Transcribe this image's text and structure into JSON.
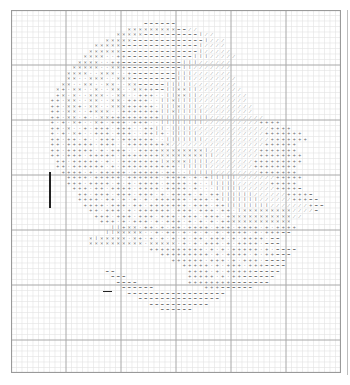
{
  "chart_data": {
    "type": "table",
    "title": "",
    "grid": {
      "columns": 60,
      "rows": 66,
      "cell_px": 5.5,
      "major_every": 10,
      "minor_color": "#e3e3e3",
      "major_color": "#a8a8a8",
      "border_color": "#9a9a9a"
    },
    "legend": {
      "x": "×",
      "+": "+",
      "-": "−",
      "/": "⁄",
      "|": "ǀ",
      ".": "·"
    },
    "pattern_rows": [
      "                                                            ",
      "                                                            ",
      "                        ------                              ",
      "                     xxxxxxxxx--//                          ",
      "                   xxxxx----------|//                       ",
      "                 xxxxx-------------|///                     ",
      "               xxxxx--------------|////                     ",
      "              xxxxxx--------------|/////                    ",
      "             xxxx..++------------|||/////                   ",
      "            xxxx..++-----------|||//////                    ",
      "           xxxxx..xx+----------||///////                    ",
      "          xxxx..xxx..+--------|||///////                    ",
      "          xx..xxx..xxx--------|||////////                   ",
      "         xx..xx..xx..xx-----|||||////////                   ",
      "        x+.xx..x..xx..xx++--||xx||////////                  ",
      "        +x.x..xxx..xx..+++..||xx||/////////                 ",
      "       ++.xx..xx..xx.++++..||x||||/////////                 ",
      "       ++.xx+.xx..xxx+++++.|||x|||//////////                ",
      "       ++.xx..+xxx..+++++++||x|||||/////////                ",
      "       ++.xx.+..xx+++++++++|||||||||//////////              ",
      "       +.+.x+..x+.+++.+++..||||||||//////////++++           ",
      "       ++.x..+.+++.+++..++||.||||//////////////++++         ",
      "       +.+.x+..+++.+++..++|+.|||||////////////+++++++       ",
      "       ++.++.+..+++.++++++..|||||||////////////+++++++      ",
      "       ++.+++++.+++..+++++++x/////////////////++++++        ",
      "       ++.+++++.+.+++..++++xxxxxxxx|/////////+++++++        ",
      "       ++.+++.+++++.+++++++xxxxxxxx||////////++++++++       ",
      "        ++.+++++.+..+++++++|xxxx||||////////+++++++++       ",
      "        ++.++++++.+.++++++++++.|||||////////++++++++        ",
      "         ++++.+.+++++.+++++.++..|||||////////+++++++        ",
      "          ++++.+++++.++++++.++++.+.+|||||///////+++++       ",
      "          +++.++++.+.+.++++.++++.+..|||||//////+++++        ",
      "           +++.++.++++.++++.++++.+...|||||//////++++-       ",
      "            ++.+++.+++.+++.+.++++.+.++||||||//////++++-     ",
      "            ++++.++.+.+.+.++++++.+++.+|||||||//////+++--    ",
      "             ++++.+++.++.+++++++.+++.++||||||||///////+--   ",
      "              ++.+++.+.++++++.+++.+++.++.|xxxxxxxxx////-    ",
      "               +++.+++.+++.+++.+++.+++.+xxxxxxxxxxx//       ",
      "                +++.+.+++.+.+++.+.+.+.++xxxxxxxxxxx         ",
      "                  ||+xx.++.+.++.++++.+++.++++.+.++++        ",
      "                 ||xxxxx..+.++.+.+.+.+.++++.+.+++--         ",
      "              x|xxxxx.x+.+.+.+.+.++.+++.+.++++.--           ",
      "              xxxxxxxxxx.xxxxx.+.+.+++.+.++++.---           ",
      "                         ++++++++++.+.+.+++++.+.----        ",
      "                           +++++++++.+.++++.+.++---         ",
      "                             ++++++.+++.+.+++.----          ",
      "                               +++++.+.+++.+++----          ",
      "                 --             ++++.+.+++++-----           ",
      "                  ---           +++++.+.++------            ",
      "                   ----         ++++++++-------             ",
      "                    ------         +++------                ",
      "                     ------------------                     ",
      "                       ---------------                      ",
      "                         -----------                        ",
      "                           ------                           ",
      "                                                            ",
      "                                                            ",
      "                                                            ",
      "                                                            ",
      "                                                            ",
      "                                                            ",
      "                                                            ",
      "                                                            ",
      "                                                            ",
      "                                                            ",
      "                                                            "
    ],
    "annotations": [
      {
        "type": "vertical-marker",
        "col": 7,
        "rows": [
          29,
          35
        ]
      },
      {
        "type": "horizontal-marker",
        "col_start": 17,
        "col_end": 18,
        "row": 51
      }
    ]
  }
}
